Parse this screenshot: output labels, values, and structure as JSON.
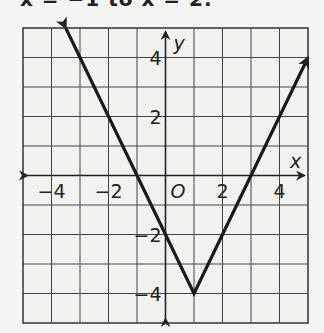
{
  "header": {
    "clipped_text": "x = −1 to x = 2."
  },
  "chart_data": {
    "type": "line",
    "title": "",
    "xlabel": "x",
    "ylabel": "y",
    "xlim": [
      -5,
      5
    ],
    "ylim": [
      -5,
      5
    ],
    "grid": true,
    "origin_label": "O",
    "x_ticks": [
      -4,
      -2,
      2,
      4
    ],
    "x_tick_labels": [
      "−4",
      "−2",
      "2",
      "4"
    ],
    "y_ticks": [
      4,
      2,
      -2,
      -4
    ],
    "y_tick_labels": [
      "4",
      "2",
      "−2",
      "−4"
    ],
    "series": [
      {
        "name": "y = 2|x − 1| − 4",
        "x": [
          -3.5,
          1,
          5
        ],
        "y": [
          5,
          -4,
          4
        ],
        "vertex": [
          1,
          -4
        ],
        "x_intercepts": [
          -1,
          3
        ],
        "y_intercept": -2,
        "arrows_at_ends": true
      }
    ]
  }
}
